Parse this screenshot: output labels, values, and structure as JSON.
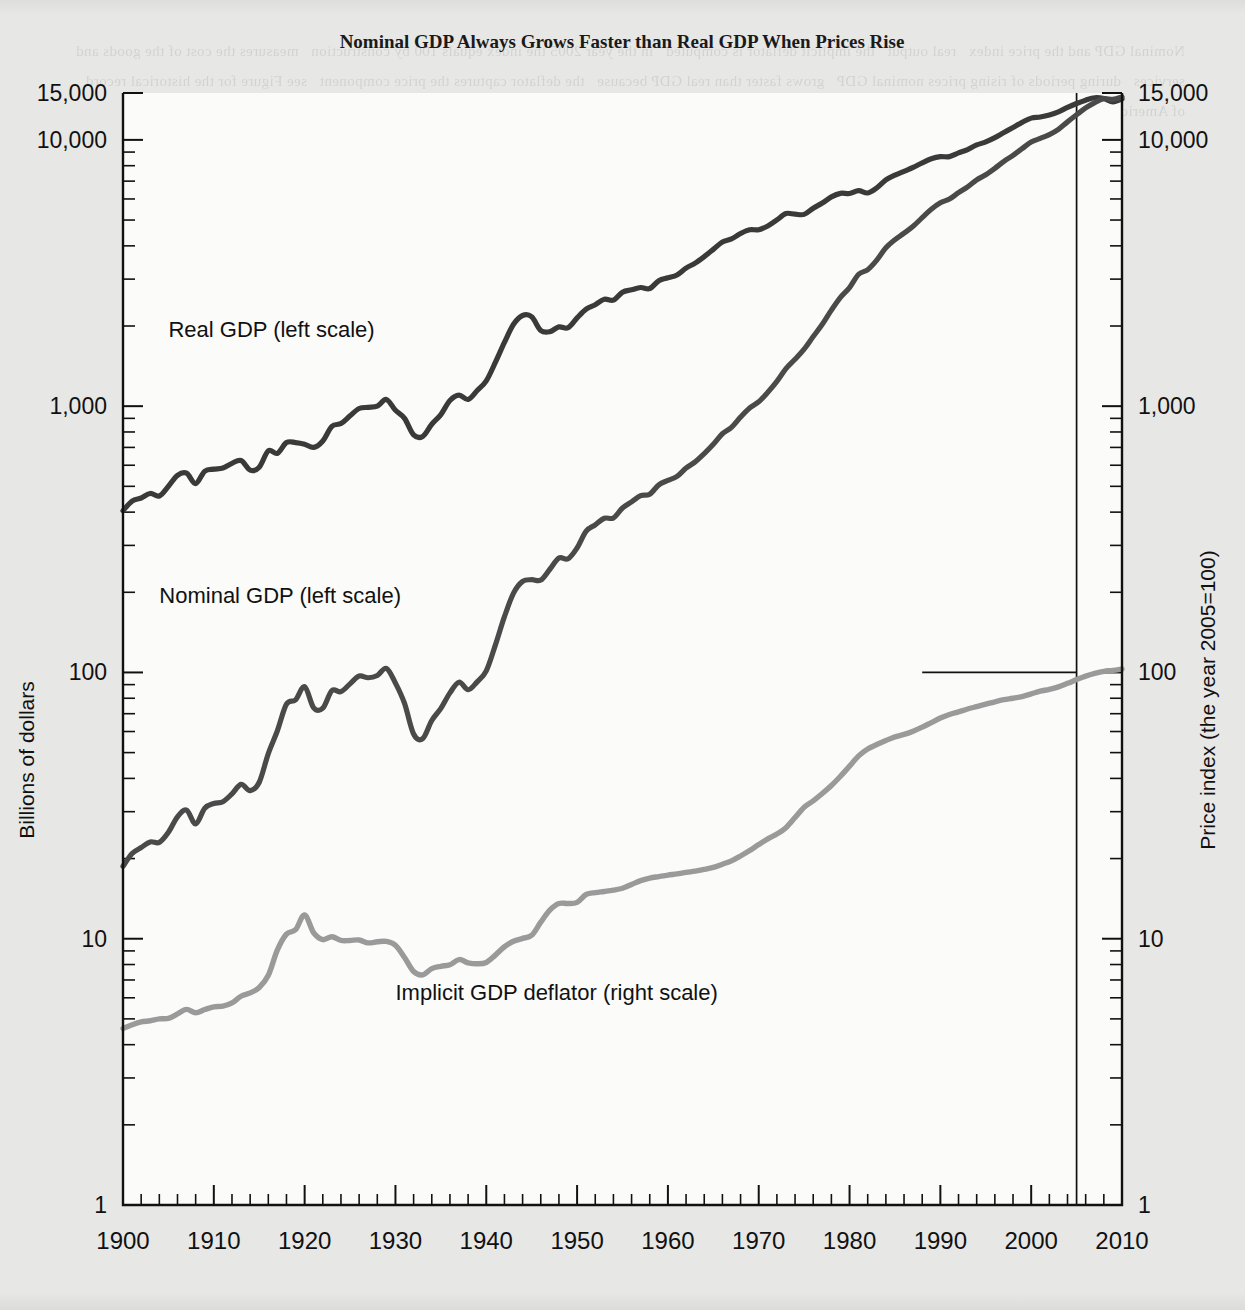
{
  "chart_data": {
    "type": "line",
    "title": "Nominal GDP Always Grows Faster than Real GDP When Prices Rise",
    "xlabel": "",
    "ylabel": "Billions of dollars",
    "ylabel_right": "Price index (the year 2005=100)",
    "x_axis": {
      "min": 1900,
      "max": 2010,
      "major_ticks": [
        1900,
        1910,
        1920,
        1930,
        1940,
        1950,
        1960,
        1970,
        1980,
        1990,
        2000,
        2010
      ],
      "tick_labels": [
        "1900",
        "1910",
        "1920",
        "1930",
        "1940",
        "1950",
        "1960",
        "1970",
        "1980",
        "1990",
        "2000",
        "2010"
      ],
      "minor_tick_interval": 2
    },
    "y_axis_left": {
      "scale": "log",
      "min": 1,
      "max": 15000,
      "tick_labels": [
        "15,000",
        "10,000",
        "1,000",
        "100",
        "10",
        "1"
      ],
      "tick_values": [
        15000,
        10000,
        1000,
        100,
        10,
        1
      ]
    },
    "y_axis_right": {
      "scale": "log",
      "min": 1,
      "max": 15000,
      "tick_labels": [
        "15,000",
        "10,000",
        "1,000",
        "100",
        "10",
        "1"
      ],
      "tick_values": [
        15000,
        10000,
        1000,
        100,
        10,
        1
      ]
    },
    "grid": false,
    "legend_position": "inline-annotations",
    "annotations": [
      {
        "text": "Real GDP (left scale)",
        "x": 1905,
        "y": 1950
      },
      {
        "text": "Nominal GDP (left scale)",
        "x": 1904,
        "y": 195
      },
      {
        "text": "Implicit GDP deflator (right scale)",
        "x": 1930,
        "y": 6.3
      }
    ],
    "reference_lines": [
      {
        "orientation": "vertical",
        "value": 2005,
        "label": "2005"
      },
      {
        "orientation": "horizontal",
        "value": 100,
        "label": "100",
        "axis": "right",
        "x_from": 1988,
        "x_to": 2005
      }
    ],
    "series": [
      {
        "name": "Real GDP (left scale)",
        "axis": "left",
        "units": "Billions of dollars",
        "color": "#3a3a3a",
        "x": [
          1900,
          1901,
          1902,
          1903,
          1904,
          1905,
          1906,
          1907,
          1908,
          1909,
          1910,
          1911,
          1912,
          1913,
          1914,
          1915,
          1916,
          1917,
          1918,
          1919,
          1920,
          1921,
          1922,
          1923,
          1924,
          1925,
          1926,
          1927,
          1928,
          1929,
          1930,
          1931,
          1932,
          1933,
          1934,
          1935,
          1936,
          1937,
          1938,
          1939,
          1940,
          1941,
          1942,
          1943,
          1944,
          1945,
          1946,
          1947,
          1948,
          1949,
          1950,
          1951,
          1952,
          1953,
          1954,
          1955,
          1956,
          1957,
          1958,
          1959,
          1960,
          1961,
          1962,
          1963,
          1964,
          1965,
          1966,
          1967,
          1968,
          1969,
          1970,
          1971,
          1972,
          1973,
          1974,
          1975,
          1976,
          1977,
          1978,
          1979,
          1980,
          1981,
          1982,
          1983,
          1984,
          1985,
          1986,
          1987,
          1988,
          1989,
          1990,
          1991,
          1992,
          1993,
          1994,
          1995,
          1996,
          1997,
          1998,
          1999,
          2000,
          2001,
          2002,
          2003,
          2004,
          2005,
          2006,
          2007,
          2008,
          2009,
          2010
        ],
        "y": [
          405,
          440,
          452,
          470,
          460,
          500,
          550,
          560,
          512,
          570,
          580,
          586,
          610,
          625,
          575,
          590,
          680,
          665,
          730,
          730,
          720,
          700,
          740,
          840,
          860,
          920,
          980,
          990,
          1000,
          1060,
          965,
          900,
          780,
          770,
          855,
          930,
          1050,
          1100,
          1060,
          1145,
          1245,
          1460,
          1735,
          2030,
          2190,
          2165,
          1925,
          1905,
          1985,
          1970,
          2145,
          2315,
          2405,
          2520,
          2500,
          2680,
          2735,
          2790,
          2765,
          2960,
          3035,
          3110,
          3300,
          3445,
          3645,
          3880,
          4135,
          4245,
          4450,
          4595,
          4600,
          4750,
          5005,
          5290,
          5260,
          5250,
          5540,
          5790,
          6110,
          6300,
          6290,
          6450,
          6320,
          6600,
          7070,
          7370,
          7620,
          7880,
          8200,
          8490,
          8650,
          8650,
          8940,
          9200,
          9570,
          9830,
          10200,
          10660,
          11130,
          11640,
          12070,
          12190,
          12400,
          12740,
          13250,
          13700,
          14100,
          14400,
          14300,
          13900,
          14250
        ],
        "notes": "Real GDP in chained 2005 dollars; severe drop 1929-1933, WWII surge, 2009 recession dip."
      },
      {
        "name": "Nominal GDP (left scale)",
        "axis": "left",
        "units": "Billions of dollars",
        "color": "#4a4a4a",
        "x": [
          1900,
          1901,
          1902,
          1903,
          1904,
          1905,
          1906,
          1907,
          1908,
          1909,
          1910,
          1911,
          1912,
          1913,
          1914,
          1915,
          1916,
          1917,
          1918,
          1919,
          1920,
          1921,
          1922,
          1923,
          1924,
          1925,
          1926,
          1927,
          1928,
          1929,
          1930,
          1931,
          1932,
          1933,
          1934,
          1935,
          1936,
          1937,
          1938,
          1939,
          1940,
          1941,
          1942,
          1943,
          1944,
          1945,
          1946,
          1947,
          1948,
          1949,
          1950,
          1951,
          1952,
          1953,
          1954,
          1955,
          1956,
          1957,
          1958,
          1959,
          1960,
          1961,
          1962,
          1963,
          1964,
          1965,
          1966,
          1967,
          1968,
          1969,
          1970,
          1971,
          1972,
          1973,
          1974,
          1975,
          1976,
          1977,
          1978,
          1979,
          1980,
          1981,
          1982,
          1983,
          1984,
          1985,
          1986,
          1987,
          1988,
          1989,
          1990,
          1991,
          1992,
          1993,
          1994,
          1995,
          1996,
          1997,
          1998,
          1999,
          2000,
          2001,
          2002,
          2003,
          2004,
          2005,
          2006,
          2007,
          2008,
          2009,
          2010
        ],
        "y": [
          18.7,
          20.9,
          22.0,
          23.1,
          23.0,
          25.1,
          28.7,
          30.4,
          27.0,
          30.9,
          32.2,
          32.7,
          35.0,
          38.0,
          36.0,
          38.7,
          49.6,
          60.4,
          76.0,
          78.9,
          88.4,
          73.6,
          73.4,
          85.4,
          84.7,
          90.6,
          96.9,
          95.5,
          97.4,
          103.6,
          91.2,
          76.5,
          58.7,
          56.4,
          66.0,
          73.3,
          83.8,
          91.9,
          86.1,
          92.2,
          101.4,
          126.7,
          161.9,
          198.6,
          219.8,
          223.0,
          222.2,
          244.1,
          269.1,
          267.2,
          293.7,
          339.3,
          358.3,
          379.3,
          380.4,
          414.7,
          437.4,
          461.1,
          467.2,
          506.6,
          526.4,
          544.7,
          585.6,
          617.7,
          663.6,
          719.1,
          787.8,
          832.6,
          910.0,
          984.6,
          1038.5,
          1127.1,
          1238.3,
          1382.7,
          1500.0,
          1638.3,
          1825.3,
          2030.9,
          2294.7,
          2563.3,
          2789.5,
          3128.4,
          3255.0,
          3536.7,
          3933.2,
          4220.3,
          4462.8,
          4739.5,
          5103.8,
          5484.4,
          5803.1,
          5995.9,
          6337.7,
          6657.4,
          7072.2,
          7397.7,
          7816.9,
          8304.3,
          8747.0,
          9268.4,
          9817.0,
          10128.0,
          10469.6,
          10960.8,
          11685.9,
          12421.9,
          13178.4,
          13807.5,
          14291.5,
          14191.2,
          14499.0
        ],
        "notes": "Nominal GDP in current dollars; crosses Real GDP at 2005 where deflator = 100."
      },
      {
        "name": "Implicit GDP deflator (right scale)",
        "axis": "right",
        "units": "Price index (the year 2005=100)",
        "color": "#9a9a9a",
        "x": [
          1900,
          1901,
          1902,
          1903,
          1904,
          1905,
          1906,
          1907,
          1908,
          1909,
          1910,
          1911,
          1912,
          1913,
          1914,
          1915,
          1916,
          1917,
          1918,
          1919,
          1920,
          1921,
          1922,
          1923,
          1924,
          1925,
          1926,
          1927,
          1928,
          1929,
          1930,
          1931,
          1932,
          1933,
          1934,
          1935,
          1936,
          1937,
          1938,
          1939,
          1940,
          1941,
          1942,
          1943,
          1944,
          1945,
          1946,
          1947,
          1948,
          1949,
          1950,
          1951,
          1952,
          1953,
          1954,
          1955,
          1956,
          1957,
          1958,
          1959,
          1960,
          1961,
          1962,
          1963,
          1964,
          1965,
          1966,
          1967,
          1968,
          1969,
          1970,
          1971,
          1972,
          1973,
          1974,
          1975,
          1976,
          1977,
          1978,
          1979,
          1980,
          1981,
          1982,
          1983,
          1984,
          1985,
          1986,
          1987,
          1988,
          1989,
          1990,
          1991,
          1992,
          1993,
          1994,
          1995,
          1996,
          1997,
          1998,
          1999,
          2000,
          2001,
          2002,
          2003,
          2004,
          2005,
          2006,
          2007,
          2008,
          2009,
          2010
        ],
        "y": [
          4.6,
          4.75,
          4.87,
          4.92,
          5.0,
          5.02,
          5.22,
          5.43,
          5.27,
          5.42,
          5.55,
          5.58,
          5.74,
          6.08,
          6.26,
          6.56,
          7.29,
          9.08,
          10.41,
          10.81,
          12.28,
          10.51,
          9.92,
          10.17,
          9.85,
          9.85,
          9.89,
          9.65,
          9.74,
          9.77,
          9.45,
          8.5,
          7.53,
          7.32,
          7.72,
          7.88,
          7.98,
          8.35,
          8.12,
          8.05,
          8.14,
          8.68,
          9.33,
          9.78,
          10.03,
          10.3,
          11.54,
          12.81,
          13.56,
          13.56,
          13.7,
          14.66,
          14.9,
          15.05,
          15.22,
          15.47,
          15.99,
          16.53,
          16.9,
          17.12,
          17.34,
          17.51,
          17.74,
          17.93,
          18.2,
          18.53,
          19.05,
          19.61,
          20.45,
          21.43,
          22.58,
          23.73,
          24.73,
          26.13,
          28.52,
          31.2,
          32.96,
          35.1,
          37.6,
          40.75,
          44.48,
          48.62,
          51.6,
          53.6,
          55.5,
          57.3,
          58.5,
          60.2,
          62.3,
          64.8,
          67.4,
          69.5,
          71.1,
          72.9,
          74.4,
          76.0,
          77.6,
          79.0,
          80.0,
          81.2,
          83.1,
          85.0,
          86.4,
          88.3,
          91.0,
          94.0,
          96.9,
          99.2,
          101.0,
          101.8,
          103.0
        ],
        "notes": "Implicit price deflator, 2005 = 100; 1920 spike, 1930s deflation, 1970s great inflation."
      }
    ]
  },
  "bleed_text": "Nominal GDP and the price index   real output   the implicit deflator is computed   in the year 2005 the index equals 100 by construction   measures the cost of the goods and services   during periods of rising prices nominal GDP   grows faster than real GDP because   the deflator captures the price component   see Figure for the historical record   of American economic growth since 1900"
}
